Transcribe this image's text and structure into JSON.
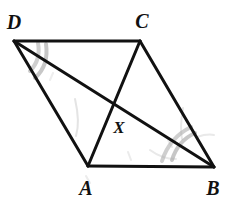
{
  "figure": {
    "kind": "geometry-diagram",
    "shape": "parallelogram-with-diagonals",
    "width": 230,
    "height": 205,
    "background_color": "#ffffff",
    "stroke_color": "#111111",
    "stroke_width": 3,
    "arc_color": "#9a9a9a",
    "smudge_color": "#bdbdbd"
  },
  "labels": {
    "D": "D",
    "C": "C",
    "A": "A",
    "B": "B",
    "X": "X"
  },
  "points": {
    "D": {
      "x": 14,
      "y": 41
    },
    "C": {
      "x": 140,
      "y": 41
    },
    "A": {
      "x": 88,
      "y": 166
    },
    "B": {
      "x": 214,
      "y": 167
    },
    "X": {
      "x": 112,
      "y": 103
    }
  },
  "label_positions": {
    "D": {
      "x": 14,
      "y": 22
    },
    "C": {
      "x": 142,
      "y": 21
    },
    "A": {
      "x": 86,
      "y": 188
    },
    "B": {
      "x": 213,
      "y": 188
    },
    "X": {
      "x": 119,
      "y": 127
    }
  },
  "segments": [
    {
      "name": "side-DC",
      "from": "D",
      "to": "C"
    },
    {
      "name": "side-CB",
      "from": "C",
      "to": "B"
    },
    {
      "name": "side-AB",
      "from": "A",
      "to": "B"
    },
    {
      "name": "side-DA",
      "from": "D",
      "to": "A"
    },
    {
      "name": "diagonal-DB",
      "from": "D",
      "to": "B"
    },
    {
      "name": "diagonal-AC",
      "from": "A",
      "to": "C"
    }
  ],
  "angle_marks": [
    {
      "name": "angle-mark-D",
      "vertex": "D",
      "arcs": 2,
      "marks_angle": "CDB"
    },
    {
      "name": "angle-mark-B",
      "vertex": "B",
      "arcs": 2,
      "marks_angle": "DBA"
    }
  ]
}
